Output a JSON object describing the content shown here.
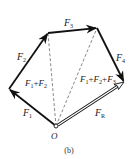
{
  "figure": {
    "caption": "(b)",
    "origin_label": "O",
    "colors": {
      "vector": "#111111",
      "dashed": "#555555",
      "resultant_fill": "#ffffff",
      "text": "#1a1a1a"
    }
  },
  "vectors": [
    {
      "id": "F1",
      "label": "F",
      "sub": "1",
      "from": [
        56,
        126
      ],
      "to": [
        9,
        89
      ],
      "style": "solid"
    },
    {
      "id": "F2",
      "label": "F",
      "sub": "2",
      "from": [
        9,
        89
      ],
      "to": [
        48,
        33
      ],
      "style": "solid"
    },
    {
      "id": "F3",
      "label": "F",
      "sub": "3",
      "from": [
        48,
        33
      ],
      "to": [
        97,
        28
      ],
      "style": "solid"
    },
    {
      "id": "F4",
      "label": "F",
      "sub": "4",
      "from": [
        97,
        28
      ],
      "to": [
        124,
        82
      ],
      "style": "solid"
    },
    {
      "id": "FR",
      "label": "F",
      "sub": "R",
      "from": [
        56,
        126
      ],
      "to": [
        124,
        82
      ],
      "style": "double"
    }
  ],
  "partial_sums": [
    {
      "id": "F1+F2",
      "label_parts": [
        "F",
        "1",
        "+F",
        "2"
      ],
      "from": [
        56,
        126
      ],
      "to": [
        48,
        33
      ],
      "style": "dashed"
    },
    {
      "id": "F1+F2+F3",
      "label_parts": [
        "F",
        "1",
        "+F",
        "2",
        "+F",
        "3"
      ],
      "from": [
        56,
        126
      ],
      "to": [
        97,
        28
      ],
      "style": "dashed"
    }
  ],
  "labels": {
    "F1": {
      "main": "F",
      "sub": "1"
    },
    "F2": {
      "main": "F",
      "sub": "2"
    },
    "F3": {
      "main": "F",
      "sub": "3"
    },
    "F4": {
      "main": "F",
      "sub": "4"
    },
    "FR": {
      "main": "F",
      "sub": "R"
    },
    "sum12": {
      "a": "F",
      "a_sub": "1",
      "plus": "+",
      "b": "F",
      "b_sub": "2"
    },
    "sum123": {
      "a": "F",
      "a_sub": "1",
      "plus1": "+",
      "b": "F",
      "b_sub": "2",
      "plus2": "+",
      "c": "F",
      "c_sub": "3"
    }
  }
}
